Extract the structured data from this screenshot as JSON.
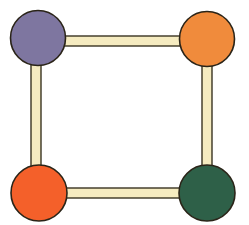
{
  "figure": {
    "type": "node-link-diagram",
    "width": 249,
    "height": 225,
    "background_color": "#FFFFFF"
  },
  "style": {
    "node_outline_color": "#2A2418",
    "node_outline_width": 1.6,
    "edge_fill_color": "#F5EBC0",
    "edge_outline_color": "#3A3422",
    "edge_outline_width": 1.4,
    "edge_thickness": 10
  },
  "nodes": [
    {
      "id": "node-top-left",
      "label": "top-left-node",
      "color": "#7E76A0",
      "color_name": "purple",
      "cx": 38,
      "cy": 38,
      "r": 27.5
    },
    {
      "id": "node-top-right",
      "label": "top-right-node",
      "color": "#F08B3C",
      "color_name": "orange",
      "cx": 207,
      "cy": 39,
      "r": 27.5
    },
    {
      "id": "node-bottom-left",
      "label": "bottom-left-node",
      "color": "#F4602A",
      "color_name": "red-orange",
      "cx": 39,
      "cy": 193,
      "r": 28
    },
    {
      "id": "node-bottom-right",
      "label": "bottom-right-node",
      "color": "#2E6048",
      "color_name": "dark-green",
      "cx": 207,
      "cy": 193,
      "r": 28
    }
  ],
  "edges": [
    {
      "id": "edge-top",
      "label": "top-edge",
      "from": "node-top-left",
      "to": "node-top-right",
      "orientation": "horizontal",
      "x": 30,
      "y": 36,
      "length": 186,
      "thickness": 10
    },
    {
      "id": "edge-left",
      "label": "left-edge",
      "from": "node-top-left",
      "to": "node-bottom-left",
      "orientation": "vertical",
      "x": 31,
      "y": 30,
      "length": 172,
      "thickness": 10
    },
    {
      "id": "edge-right",
      "label": "right-edge",
      "from": "node-top-right",
      "to": "node-bottom-right",
      "orientation": "vertical",
      "x": 202,
      "y": 32,
      "length": 170,
      "thickness": 10
    },
    {
      "id": "edge-bottom",
      "label": "bottom-edge",
      "from": "node-bottom-left",
      "to": "node-bottom-right",
      "orientation": "horizontal",
      "x": 32,
      "y": 188,
      "length": 184,
      "thickness": 10
    }
  ]
}
